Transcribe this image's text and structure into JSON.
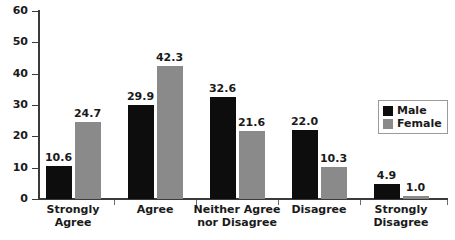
{
  "chart_data": {
    "type": "bar",
    "title": "",
    "subtitle": "",
    "xlabel": "",
    "ylabel": "",
    "ylim": [
      0,
      60
    ],
    "yticks": [
      0,
      10,
      20,
      30,
      40,
      50,
      60
    ],
    "grid": false,
    "legend_position": "right",
    "categories": [
      "Strongly\nAgree",
      "Agree",
      "Neither Agree\nnor Disagree",
      "Disagree",
      "Strongly\nDisagree"
    ],
    "series": [
      {
        "name": "Male",
        "color": "#0d0d0d",
        "values": [
          10.6,
          29.9,
          32.6,
          22.0,
          4.9
        ],
        "labels": [
          "10.6",
          "29.9",
          "32.6",
          "22.0",
          "4.9"
        ]
      },
      {
        "name": "Female",
        "color": "#8a8a8a",
        "values": [
          24.7,
          42.3,
          21.6,
          10.3,
          1.0
        ],
        "labels": [
          "24.7",
          "42.3",
          "21.6",
          "10.3",
          "1.0"
        ]
      }
    ]
  },
  "axis": {
    "tick_labels": [
      "0",
      "10",
      "20",
      "30",
      "40",
      "50",
      "60"
    ]
  },
  "legend": {
    "items": [
      {
        "label": "Male",
        "color": "#0d0d0d"
      },
      {
        "label": "Female",
        "color": "#8a8a8a"
      }
    ]
  }
}
